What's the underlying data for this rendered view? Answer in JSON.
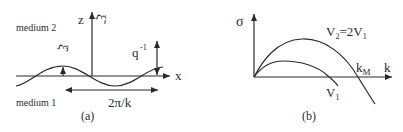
{
  "panel_a": {
    "caption": "(a)",
    "medium_top": "medium 2",
    "medium_bottom": "medium 1",
    "z_label": "z",
    "xi_tilde_label": "ξ̃",
    "xi_hat_label": "ξ̂",
    "x_label": "x",
    "q_label": "q",
    "q_exp": "-1",
    "wavelength_label": "2π/k"
  },
  "panel_b": {
    "caption": "(b)",
    "y_label": "σ",
    "x_label": "k",
    "curve_upper_label_v": "V",
    "curve_upper_sub2": "2",
    "curve_upper_eq": "=2V",
    "curve_upper_sub1": "1",
    "curve_lower_label_v": "V",
    "curve_lower_sub": "1",
    "km_label": "k",
    "km_sub": "M"
  },
  "colors": {
    "ink": "#2a2a2a",
    "background": "#ffffff"
  }
}
